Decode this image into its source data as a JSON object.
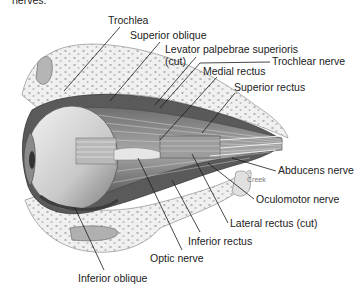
{
  "figure": {
    "top_fragment": "nerves."
  },
  "labels": [
    {
      "id": "trochlea",
      "text": "Trochlea",
      "x": 108,
      "y": 15
    },
    {
      "id": "superior-oblique",
      "text": "Superior oblique",
      "x": 130,
      "y": 30
    },
    {
      "id": "levator-palpebrae",
      "text": "Levator palpebrae superioris",
      "x": 165,
      "y": 45
    },
    {
      "id": "levator-cut",
      "text": "(cut)",
      "x": 165,
      "y": 56
    },
    {
      "id": "trochlear-nerve",
      "text": "Trochlear nerve",
      "x": 272,
      "y": 56
    },
    {
      "id": "medial-rectus",
      "text": "Medial rectus",
      "x": 203,
      "y": 66
    },
    {
      "id": "superior-rectus",
      "text": "Superior rectus",
      "x": 234,
      "y": 82
    },
    {
      "id": "creek",
      "text": "Creek",
      "x": 247,
      "y": 174,
      "small": true
    },
    {
      "id": "abducens-nerve",
      "text": "Abducens nerve",
      "x": 278,
      "y": 165
    },
    {
      "id": "oculomotor-nerve",
      "text": "Oculomotor nerve",
      "x": 256,
      "y": 195
    },
    {
      "id": "lateral-rectus",
      "text": "Lateral rectus (cut)",
      "x": 230,
      "y": 218
    },
    {
      "id": "inferior-rectus",
      "text": "Inferior rectus",
      "x": 188,
      "y": 236
    },
    {
      "id": "optic-nerve",
      "text": "Optic nerve",
      "x": 150,
      "y": 253
    },
    {
      "id": "inferior-oblique",
      "text": "Inferior oblique",
      "x": 78,
      "y": 273
    }
  ],
  "leaders": [
    {
      "for": "trochlea",
      "x1": 120,
      "y1": 27,
      "x2": 64,
      "y2": 91
    },
    {
      "for": "superior-oblique",
      "x1": 160,
      "y1": 42,
      "x2": 110,
      "y2": 101
    },
    {
      "for": "levator-palpebrae",
      "x1": 196,
      "y1": 57,
      "x2": 155,
      "y2": 105
    },
    {
      "for": "trochlear-nerve",
      "x1": 270,
      "y1": 62,
      "x2": 200,
      "y2": 63
    },
    {
      "for": "trochlear-nerve-2",
      "x1": 200,
      "y1": 63,
      "x2": 160,
      "y2": 108
    },
    {
      "for": "medial-rectus",
      "x1": 217,
      "y1": 77,
      "x2": 160,
      "y2": 140
    },
    {
      "for": "superior-rectus",
      "x1": 235,
      "y1": 93,
      "x2": 202,
      "y2": 133
    },
    {
      "for": "abducens-nerve",
      "x1": 276,
      "y1": 171,
      "x2": 232,
      "y2": 158
    },
    {
      "for": "oculomotor-nerve",
      "x1": 254,
      "y1": 199,
      "x2": 208,
      "y2": 163
    },
    {
      "for": "lateral-rectus",
      "x1": 228,
      "y1": 223,
      "x2": 192,
      "y2": 154
    },
    {
      "for": "inferior-rectus",
      "x1": 200,
      "y1": 232,
      "x2": 172,
      "y2": 180
    },
    {
      "for": "optic-nerve",
      "x1": 182,
      "y1": 250,
      "x2": 138,
      "y2": 158
    },
    {
      "for": "inferior-oblique",
      "x1": 104,
      "y1": 270,
      "x2": 75,
      "y2": 208
    }
  ],
  "colors": {
    "background": "#ffffff",
    "bone": "#ececec",
    "bone_outline": "#9a9a9a",
    "muscle": "#8a8a8a",
    "muscle_dark": "#555555",
    "eyeball": "#d6d6d6",
    "text": "#222222",
    "leader": "#1a1a1a"
  }
}
